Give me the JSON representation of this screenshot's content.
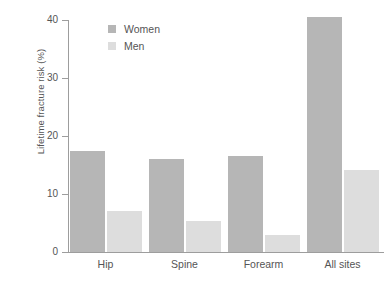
{
  "chart_data": {
    "type": "bar",
    "title": "",
    "subtitle": "",
    "xlabel": "",
    "ylabel": "Lifetime fracture risk (%)",
    "categories": [
      "Hip",
      "Spine",
      "Forearm",
      "All sites"
    ],
    "series": [
      {
        "name": "Women",
        "color": "#b6b6b6",
        "values": [
          17.5,
          16.0,
          16.5,
          40.5
        ]
      },
      {
        "name": "Men",
        "color": "#dddddd",
        "values": [
          7.0,
          5.3,
          3.0,
          14.2
        ]
      }
    ],
    "ylim": [
      0,
      40
    ],
    "yticks": [
      0,
      10,
      20,
      30,
      40
    ],
    "ytick_labels": [
      "0",
      "10",
      "20",
      "30",
      "40"
    ],
    "grid": false,
    "legend_position": "top-left-inside",
    "background_color": "#ffffff",
    "axis_color": "#9d9d9d",
    "text_color": "#555555"
  },
  "legend": {
    "entries": [
      {
        "label": "Women"
      },
      {
        "label": "Men"
      }
    ]
  }
}
